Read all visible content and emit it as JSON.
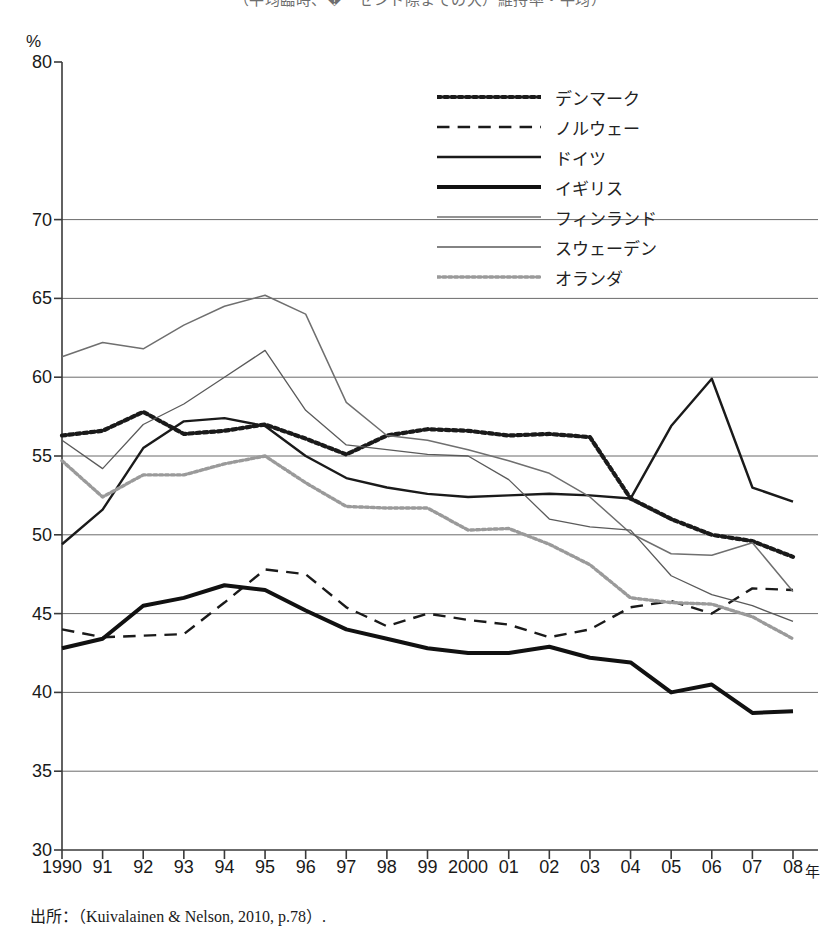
{
  "figure": {
    "clipped_title": "（平均臨時、�ーセント際までの大）維持率・平均）",
    "y_axis_unit": "%",
    "x_axis_unit": "年",
    "source_note": "出所：（Kuivalainen & Nelson, 2010, p.78）."
  },
  "legend": {
    "items": [
      {
        "label": "デンマーク",
        "key": "dotted-thick-black",
        "color": "#1a1a1a"
      },
      {
        "label": "ノルウェー",
        "key": "dashed-black",
        "color": "#1a1a1a"
      },
      {
        "label": "ドイツ",
        "key": "solid-medium-black",
        "color": "#1a1a1a"
      },
      {
        "label": "イギリス",
        "key": "solid-thick-black",
        "color": "#111111"
      },
      {
        "label": "フィンランド",
        "key": "solid-thin-gray",
        "color": "#6f6f6f"
      },
      {
        "label": "スウェーデン",
        "key": "solid-thin-gray2",
        "color": "#5a5a5a"
      },
      {
        "label": "オランダ",
        "key": "dotted-gray",
        "color": "#9a9a9a"
      }
    ]
  },
  "chart_data": {
    "type": "line",
    "title": "",
    "xlabel": "年",
    "ylabel": "%",
    "xlim": [
      1990,
      2008
    ],
    "ylim": [
      30,
      80
    ],
    "grid": true,
    "grid_values": [
      35,
      40,
      45,
      50,
      55,
      60,
      65,
      70
    ],
    "ytick_labels": [
      "30",
      "35",
      "40",
      "45",
      "50",
      "55",
      "60",
      "65",
      "70",
      "80"
    ],
    "ytick_values": [
      30,
      35,
      40,
      45,
      50,
      55,
      60,
      65,
      70,
      80
    ],
    "legend_position": "top-right",
    "x": [
      1990,
      1991,
      1992,
      1993,
      1994,
      1995,
      1996,
      1997,
      1998,
      1999,
      2000,
      2001,
      2002,
      2003,
      2004,
      2005,
      2006,
      2007,
      2008
    ],
    "xtick_labels": [
      "1990",
      "91",
      "92",
      "93",
      "94",
      "95",
      "96",
      "97",
      "98",
      "99",
      "2000",
      "01",
      "02",
      "03",
      "04",
      "05",
      "06",
      "07",
      "08"
    ],
    "series": [
      {
        "name": "デンマーク",
        "style": "dotted",
        "width": 4.2,
        "color": "#1a1a1a",
        "values": [
          56.3,
          56.6,
          57.8,
          56.4,
          56.6,
          57.0,
          56.1,
          55.1,
          56.3,
          56.7,
          56.6,
          56.3,
          56.4,
          56.2,
          52.3,
          51.0,
          50.0,
          49.6,
          48.6
        ]
      },
      {
        "name": "ノルウェー",
        "style": "dashed",
        "width": 2.4,
        "color": "#1a1a1a",
        "values": [
          44.0,
          43.5,
          43.6,
          43.7,
          45.7,
          47.8,
          47.5,
          45.4,
          44.2,
          45.0,
          44.6,
          44.3,
          43.5,
          44.0,
          45.4,
          45.8,
          45.0,
          46.6,
          46.5
        ]
      },
      {
        "name": "ドイツ",
        "style": "solid",
        "width": 2.4,
        "color": "#1a1a1a",
        "values": [
          49.4,
          51.6,
          55.5,
          57.2,
          57.4,
          56.9,
          55.0,
          53.6,
          53.0,
          52.6,
          52.4,
          52.5,
          52.6,
          52.5,
          52.3,
          56.9,
          59.9,
          53.0,
          52.1
        ]
      },
      {
        "name": "イギリス",
        "style": "solid",
        "width": 4.0,
        "color": "#111111",
        "values": [
          42.8,
          43.4,
          45.5,
          46.0,
          46.8,
          46.5,
          45.2,
          44.0,
          43.4,
          42.8,
          42.5,
          42.5,
          42.9,
          42.2,
          41.9,
          40.0,
          40.5,
          38.7,
          38.8
        ]
      },
      {
        "name": "フィンランド",
        "style": "solid",
        "width": 1.5,
        "color": "#6f6f6f",
        "values": [
          61.3,
          62.2,
          61.8,
          63.3,
          64.5,
          65.2,
          64.0,
          58.4,
          56.3,
          56.0,
          55.4,
          54.7,
          53.9,
          52.4,
          50.1,
          48.8,
          48.7,
          49.5,
          46.4
        ]
      },
      {
        "name": "スウェーデン",
        "style": "solid",
        "width": 1.3,
        "color": "#5a5a5a",
        "values": [
          56.0,
          54.2,
          57.0,
          58.3,
          60.0,
          61.7,
          57.9,
          55.7,
          55.4,
          55.1,
          55.0,
          53.5,
          51.0,
          50.5,
          50.3,
          47.4,
          46.2,
          45.5,
          44.5
        ]
      },
      {
        "name": "オランダ",
        "style": "dotted",
        "width": 3.4,
        "color": "#9a9a9a",
        "values": [
          54.7,
          52.4,
          53.8,
          53.8,
          54.5,
          55.0,
          53.3,
          51.8,
          51.7,
          51.7,
          50.3,
          50.4,
          49.4,
          48.1,
          46.0,
          45.7,
          45.6,
          44.8,
          43.4
        ]
      }
    ]
  }
}
